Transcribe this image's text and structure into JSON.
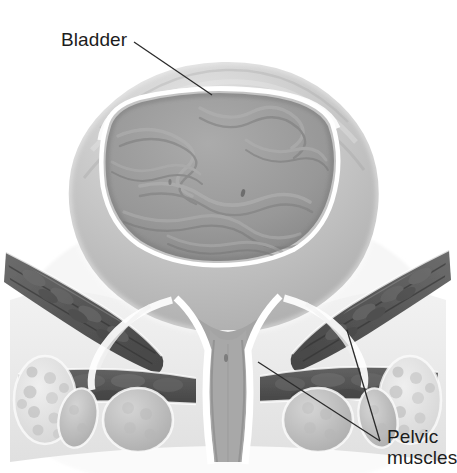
{
  "figure": {
    "kind": "anatomical-illustration",
    "background_color": "#ffffff",
    "width": 455,
    "height": 473
  },
  "labels": {
    "bladder": {
      "text": "Bladder",
      "color": "#1c1c1c",
      "leader": {
        "from_x": 134,
        "from_y": 42,
        "to_x": 212,
        "to_y": 95
      }
    },
    "pelvic_muscles": {
      "line1": "Pelvic",
      "line2": "muscles",
      "color": "#1c1c1c",
      "leaders": [
        {
          "from_x": 380,
          "from_y": 441,
          "to_x": 347,
          "to_y": 330
        },
        {
          "from_x": 380,
          "from_y": 441,
          "to_x": 258,
          "to_y": 362
        }
      ]
    }
  },
  "palette": {
    "outer_wall": "#b9b9b9",
    "wall_highlight": "#d8d8d8",
    "white_lining": "#fbfbfb",
    "lumen": "#9a9a9a",
    "lumen_shadow": "#8a8a8a",
    "rugae": "#8e8e8e",
    "muscle_dark": "#5d5d5d",
    "muscle_darker": "#4a4a4a",
    "muscle_mid": "#767676",
    "bone_light": "#e2e2e2",
    "bone_speckle": "#c4c4c4",
    "soft_tissue": "#ededed",
    "leader_line": "#2b2b2b"
  },
  "structures": [
    {
      "name": "bladder-dome",
      "description": "Domed muscular bladder wall, upper half, light gray with banded shading"
    },
    {
      "name": "bladder-lumen",
      "description": "Inner bladder cavity showing mucosal rugae folds in medium gray"
    },
    {
      "name": "bladder-lining",
      "description": "Bright white submucosal line separating wall from lumen"
    },
    {
      "name": "bladder-neck",
      "description": "Funnel where bladder narrows toward the urethra"
    },
    {
      "name": "urethra",
      "description": "Vertical channel descending from the bladder neck to the bottom of the figure"
    },
    {
      "name": "pelvic-muscle-left",
      "description": "Dark striated muscle band sloping down-right on the left side"
    },
    {
      "name": "pelvic-muscle-right",
      "description": "Dark striated muscle band sloping down-left on the right side"
    },
    {
      "name": "pelvic-floor-band",
      "description": "Horizontal dark muscle layer across the lower portion"
    },
    {
      "name": "bone-left",
      "description": "Light speckled cancellous bone cross-section, lower left"
    },
    {
      "name": "bone-right",
      "description": "Light speckled cancellous bone cross-section, lower right"
    },
    {
      "name": "muscle-bundles-bottom",
      "description": "Rounded cross-sections of muscle bundles along the bottom edge"
    }
  ]
}
